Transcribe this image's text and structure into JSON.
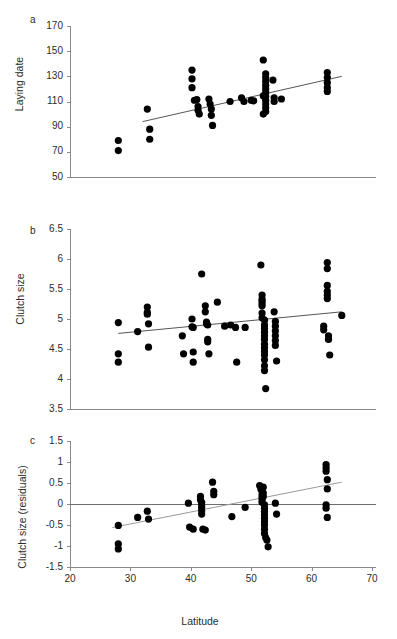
{
  "figure": {
    "panels": [
      {
        "letter": "a",
        "ylabel": "Laying date",
        "xlabel": "",
        "yticks": [
          170,
          150,
          130,
          110,
          90,
          70,
          50
        ],
        "xticks": [
          20,
          30,
          40,
          50,
          60,
          70
        ]
      },
      {
        "letter": "b",
        "ylabel": "Clutch size",
        "xlabel": "",
        "yticks": [
          6.5,
          6,
          5.5,
          5,
          4.5,
          4,
          3.5
        ],
        "xticks": [
          20,
          30,
          40,
          50,
          60,
          70
        ]
      },
      {
        "letter": "c",
        "ylabel": "Clutch size (residuals)",
        "xlabel": "Latitude",
        "yticks": [
          1.5,
          1,
          0.5,
          0,
          -0.5,
          -1,
          -1.5
        ],
        "xticks": [
          20,
          30,
          40,
          50,
          60,
          70
        ]
      }
    ]
  },
  "chart_data": [
    {
      "type": "scatter",
      "panel": "a",
      "title": "",
      "xlabel": "Latitude",
      "ylabel": "Laying date",
      "xlim": [
        20,
        70
      ],
      "ylim": [
        50,
        170
      ],
      "ytick_labels": [
        "170",
        "150",
        "130",
        "110",
        "90",
        "70",
        "50"
      ],
      "xtick_labels": [
        "20",
        "30",
        "40",
        "50",
        "60",
        "70"
      ],
      "grid": false,
      "legend": null,
      "trendline": {
        "x": [
          32.0,
          65.0
        ],
        "y": [
          94.0,
          130.0
        ],
        "color": "#555555"
      },
      "points": [
        {
          "x": 28.0,
          "y": 79.0
        },
        {
          "x": 28.0,
          "y": 71.0
        },
        {
          "x": 32.8,
          "y": 104.0
        },
        {
          "x": 33.2,
          "y": 88.0
        },
        {
          "x": 33.2,
          "y": 80.0
        },
        {
          "x": 40.2,
          "y": 135.0
        },
        {
          "x": 40.2,
          "y": 128.0
        },
        {
          "x": 40.2,
          "y": 121.0
        },
        {
          "x": 40.6,
          "y": 111.0
        },
        {
          "x": 41.0,
          "y": 111.5
        },
        {
          "x": 41.2,
          "y": 106.0
        },
        {
          "x": 41.2,
          "y": 103.0
        },
        {
          "x": 41.4,
          "y": 100.0
        },
        {
          "x": 43.0,
          "y": 112.0
        },
        {
          "x": 43.2,
          "y": 108.0
        },
        {
          "x": 43.4,
          "y": 104.0
        },
        {
          "x": 43.4,
          "y": 99.0
        },
        {
          "x": 43.6,
          "y": 91.0
        },
        {
          "x": 46.5,
          "y": 110.0
        },
        {
          "x": 48.4,
          "y": 113.0
        },
        {
          "x": 48.8,
          "y": 110.0
        },
        {
          "x": 50.0,
          "y": 111.0
        },
        {
          "x": 50.4,
          "y": 110.5
        },
        {
          "x": 52.0,
          "y": 143.0
        },
        {
          "x": 52.4,
          "y": 132.0
        },
        {
          "x": 52.4,
          "y": 129.0
        },
        {
          "x": 52.4,
          "y": 126.0
        },
        {
          "x": 52.4,
          "y": 123.0
        },
        {
          "x": 52.4,
          "y": 120.0
        },
        {
          "x": 52.4,
          "y": 117.0
        },
        {
          "x": 52.4,
          "y": 114.0
        },
        {
          "x": 52.4,
          "y": 111.0
        },
        {
          "x": 52.4,
          "y": 108.0
        },
        {
          "x": 52.4,
          "y": 105.0
        },
        {
          "x": 52.4,
          "y": 102.0
        },
        {
          "x": 52.0,
          "y": 114.5
        },
        {
          "x": 52.0,
          "y": 100.0
        },
        {
          "x": 53.6,
          "y": 127.0
        },
        {
          "x": 53.8,
          "y": 113.0
        },
        {
          "x": 53.8,
          "y": 110.0
        },
        {
          "x": 55.0,
          "y": 112.0
        },
        {
          "x": 62.6,
          "y": 133.0
        },
        {
          "x": 62.6,
          "y": 129.0
        },
        {
          "x": 62.6,
          "y": 125.0
        },
        {
          "x": 62.6,
          "y": 121.0
        },
        {
          "x": 62.6,
          "y": 118.0
        }
      ]
    },
    {
      "type": "scatter",
      "panel": "b",
      "title": "",
      "xlabel": "Latitude",
      "ylabel": "Clutch size",
      "xlim": [
        20,
        70
      ],
      "ylim": [
        3.5,
        6.5
      ],
      "ytick_labels": [
        "6.5",
        "6",
        "5.5",
        "5",
        "4.5",
        "4",
        "3.5"
      ],
      "xtick_labels": [
        "20",
        "30",
        "40",
        "50",
        "60",
        "70"
      ],
      "grid": false,
      "legend": null,
      "trendline": {
        "x": [
          28.0,
          65.0
        ],
        "y": [
          4.76,
          5.12
        ],
        "color": "#555555"
      },
      "points": [
        {
          "x": 28.0,
          "y": 4.94
        },
        {
          "x": 28.0,
          "y": 4.42
        },
        {
          "x": 28.0,
          "y": 4.28
        },
        {
          "x": 31.2,
          "y": 4.79
        },
        {
          "x": 32.8,
          "y": 5.2
        },
        {
          "x": 32.8,
          "y": 5.11
        },
        {
          "x": 32.8,
          "y": 5.08
        },
        {
          "x": 33.0,
          "y": 4.92
        },
        {
          "x": 33.0,
          "y": 4.53
        },
        {
          "x": 38.6,
          "y": 4.72
        },
        {
          "x": 38.8,
          "y": 4.42
        },
        {
          "x": 40.2,
          "y": 5.0
        },
        {
          "x": 40.2,
          "y": 4.87
        },
        {
          "x": 40.4,
          "y": 4.86
        },
        {
          "x": 40.4,
          "y": 4.45
        },
        {
          "x": 40.4,
          "y": 4.28
        },
        {
          "x": 41.8,
          "y": 5.75
        },
        {
          "x": 42.4,
          "y": 5.22
        },
        {
          "x": 42.4,
          "y": 5.12
        },
        {
          "x": 42.6,
          "y": 4.95
        },
        {
          "x": 42.6,
          "y": 4.92
        },
        {
          "x": 42.8,
          "y": 4.9
        },
        {
          "x": 42.8,
          "y": 4.66
        },
        {
          "x": 42.8,
          "y": 4.62
        },
        {
          "x": 43.0,
          "y": 4.42
        },
        {
          "x": 44.4,
          "y": 5.28
        },
        {
          "x": 45.6,
          "y": 4.88
        },
        {
          "x": 46.6,
          "y": 4.9
        },
        {
          "x": 47.4,
          "y": 4.86
        },
        {
          "x": 47.6,
          "y": 4.28
        },
        {
          "x": 49.0,
          "y": 4.86
        },
        {
          "x": 51.6,
          "y": 5.9
        },
        {
          "x": 51.8,
          "y": 5.4
        },
        {
          "x": 51.8,
          "y": 5.33
        },
        {
          "x": 51.8,
          "y": 5.3
        },
        {
          "x": 51.8,
          "y": 5.26
        },
        {
          "x": 51.8,
          "y": 5.22
        },
        {
          "x": 51.8,
          "y": 5.1
        },
        {
          "x": 51.8,
          "y": 5.02
        },
        {
          "x": 52.2,
          "y": 4.98
        },
        {
          "x": 52.2,
          "y": 4.9
        },
        {
          "x": 52.2,
          "y": 4.84
        },
        {
          "x": 52.2,
          "y": 4.78
        },
        {
          "x": 52.2,
          "y": 4.72
        },
        {
          "x": 52.2,
          "y": 4.66
        },
        {
          "x": 52.2,
          "y": 4.58
        },
        {
          "x": 52.2,
          "y": 4.52
        },
        {
          "x": 52.2,
          "y": 4.46
        },
        {
          "x": 52.2,
          "y": 4.4
        },
        {
          "x": 52.2,
          "y": 4.32
        },
        {
          "x": 52.2,
          "y": 4.22
        },
        {
          "x": 52.2,
          "y": 4.14
        },
        {
          "x": 52.4,
          "y": 3.84
        },
        {
          "x": 53.8,
          "y": 5.12
        },
        {
          "x": 54.0,
          "y": 4.96
        },
        {
          "x": 54.0,
          "y": 4.88
        },
        {
          "x": 54.0,
          "y": 4.8
        },
        {
          "x": 54.0,
          "y": 4.72
        },
        {
          "x": 54.0,
          "y": 4.64
        },
        {
          "x": 54.0,
          "y": 4.56
        },
        {
          "x": 54.2,
          "y": 4.3
        },
        {
          "x": 62.6,
          "y": 5.94
        },
        {
          "x": 62.6,
          "y": 5.84
        },
        {
          "x": 62.6,
          "y": 5.56
        },
        {
          "x": 62.6,
          "y": 5.46
        },
        {
          "x": 62.6,
          "y": 5.4
        },
        {
          "x": 62.6,
          "y": 5.34
        },
        {
          "x": 62.0,
          "y": 4.88
        },
        {
          "x": 62.0,
          "y": 4.82
        },
        {
          "x": 62.8,
          "y": 4.72
        },
        {
          "x": 62.8,
          "y": 4.66
        },
        {
          "x": 63.0,
          "y": 4.4
        },
        {
          "x": 65.0,
          "y": 5.06
        }
      ]
    },
    {
      "type": "scatter",
      "panel": "c",
      "title": "",
      "xlabel": "Latitude",
      "ylabel": "Clutch size (residuals)",
      "xlim": [
        20,
        70
      ],
      "ylim": [
        -1.5,
        1.5
      ],
      "ytick_labels": [
        "1.5",
        "1",
        "0.5",
        "0",
        "-0.5",
        "-1",
        "-1.5"
      ],
      "xtick_labels": [
        "20",
        "30",
        "40",
        "50",
        "60",
        "70"
      ],
      "grid": false,
      "legend": null,
      "zero_reference_line": 0,
      "trendline": {
        "x": [
          27.0,
          65.0
        ],
        "y": [
          -0.56,
          0.52
        ],
        "color": "#9a9a9a"
      },
      "points": [
        {
          "x": 28.0,
          "y": -0.51
        },
        {
          "x": 28.0,
          "y": -0.95
        },
        {
          "x": 28.0,
          "y": -1.07
        },
        {
          "x": 31.2,
          "y": -0.32
        },
        {
          "x": 32.8,
          "y": -0.17
        },
        {
          "x": 33.0,
          "y": -0.36
        },
        {
          "x": 39.6,
          "y": 0.02
        },
        {
          "x": 39.8,
          "y": -0.55
        },
        {
          "x": 40.4,
          "y": -0.6
        },
        {
          "x": 41.6,
          "y": 0.18
        },
        {
          "x": 41.6,
          "y": 0.1
        },
        {
          "x": 41.8,
          "y": 0.04
        },
        {
          "x": 41.8,
          "y": -0.02
        },
        {
          "x": 41.8,
          "y": -0.08
        },
        {
          "x": 41.8,
          "y": -0.16
        },
        {
          "x": 41.8,
          "y": -0.24
        },
        {
          "x": 42.0,
          "y": -0.6
        },
        {
          "x": 42.4,
          "y": -0.62
        },
        {
          "x": 43.6,
          "y": 0.52
        },
        {
          "x": 43.8,
          "y": 0.3
        },
        {
          "x": 43.8,
          "y": 0.22
        },
        {
          "x": 46.8,
          "y": -0.3
        },
        {
          "x": 49.0,
          "y": -0.08
        },
        {
          "x": 51.4,
          "y": 0.44
        },
        {
          "x": 51.6,
          "y": 0.36
        },
        {
          "x": 51.8,
          "y": 0.3
        },
        {
          "x": 51.8,
          "y": 0.22
        },
        {
          "x": 51.8,
          "y": 0.16
        },
        {
          "x": 51.8,
          "y": 0.1
        },
        {
          "x": 51.8,
          "y": 0.04
        },
        {
          "x": 52.0,
          "y": 0.4
        },
        {
          "x": 52.0,
          "y": 0.26
        },
        {
          "x": 52.0,
          "y": 0.18
        },
        {
          "x": 52.2,
          "y": -0.02
        },
        {
          "x": 52.2,
          "y": -0.1
        },
        {
          "x": 52.2,
          "y": -0.18
        },
        {
          "x": 52.2,
          "y": -0.26
        },
        {
          "x": 52.2,
          "y": -0.34
        },
        {
          "x": 52.2,
          "y": -0.42
        },
        {
          "x": 52.2,
          "y": -0.5
        },
        {
          "x": 52.2,
          "y": -0.6
        },
        {
          "x": 52.2,
          "y": -0.7
        },
        {
          "x": 52.4,
          "y": -0.8
        },
        {
          "x": 52.6,
          "y": -0.86
        },
        {
          "x": 52.8,
          "y": -1.02
        },
        {
          "x": 54.0,
          "y": 0.02
        },
        {
          "x": 54.2,
          "y": -0.24
        },
        {
          "x": 62.4,
          "y": 0.86
        },
        {
          "x": 62.4,
          "y": 0.78
        },
        {
          "x": 62.4,
          "y": 0.94
        },
        {
          "x": 62.6,
          "y": 0.58
        },
        {
          "x": 62.6,
          "y": 0.36
        },
        {
          "x": 62.4,
          "y": -0.02
        },
        {
          "x": 62.4,
          "y": -0.1
        },
        {
          "x": 62.6,
          "y": -0.32
        }
      ]
    }
  ]
}
